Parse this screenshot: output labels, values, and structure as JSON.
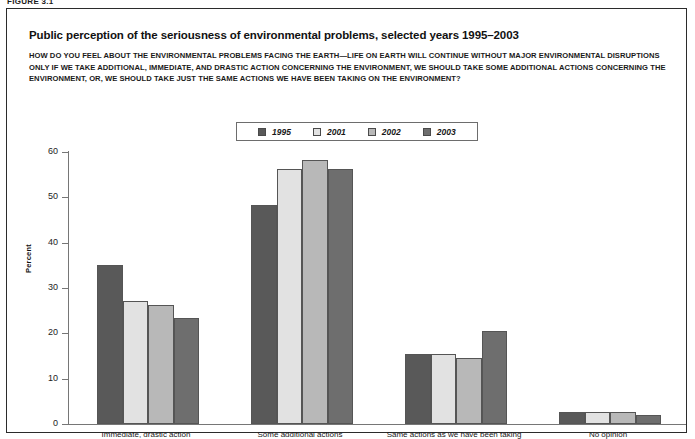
{
  "figure_tag": "FIGURE 3.1",
  "header": {
    "title": "Public perception of the seriousness of environmental problems, selected years 1995–2003",
    "question": "HOW DO YOU FEEL ABOUT THE ENVIRONMENTAL PROBLEMS FACING THE EARTH—LIFE ON EARTH WILL CONTINUE WITHOUT MAJOR ENVIRONMENTAL DISRUPTIONS ONLY IF WE TAKE ADDITIONAL, IMMEDIATE, AND DRASTIC ACTION CONCERNING THE ENVIRONMENT, WE SHOULD TAKE SOME ADDITIONAL ACTIONS CONCERNING THE ENVIRONMENT, OR, WE SHOULD TAKE JUST THE SAME ACTIONS WE HAVE BEEN TAKING ON THE ENVIRONMENT?"
  },
  "chart_data": {
    "type": "bar",
    "title": "Public perception of the seriousness of environmental problems, selected years 1995–2003",
    "xlabel": "",
    "ylabel": "Percent",
    "ylim": [
      0,
      60
    ],
    "yticks": [
      0,
      10,
      20,
      30,
      40,
      50,
      60
    ],
    "grid": false,
    "legend_position": "top-center",
    "categories": [
      "Immediate, drastic action",
      "Some additional actions",
      "Same actions as we have been taking",
      "No opinion"
    ],
    "series": [
      {
        "name": "1995",
        "color": "#595959",
        "values": [
          35.1,
          48.4,
          15.5,
          2.6
        ]
      },
      {
        "name": "2001",
        "color": "#e2e2e2",
        "values": [
          27.2,
          56.3,
          15.4,
          2.6
        ]
      },
      {
        "name": "2002",
        "color": "#b8b8b8",
        "values": [
          26.3,
          58.3,
          14.6,
          2.6
        ]
      },
      {
        "name": "2003",
        "color": "#6e6e6e",
        "values": [
          23.4,
          56.3,
          20.6,
          1.9
        ]
      }
    ]
  }
}
